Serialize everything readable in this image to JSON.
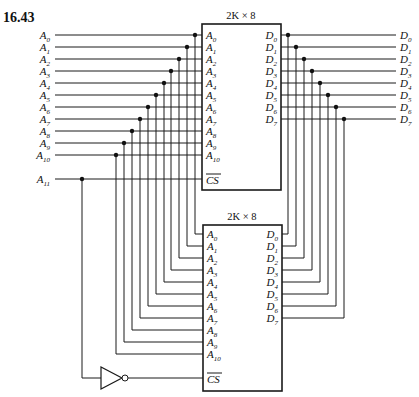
{
  "figure": {
    "number": "16.43"
  },
  "inputs": {
    "address_labels": [
      "A0",
      "A1",
      "A2",
      "A3",
      "A4",
      "A5",
      "A6",
      "A7",
      "A8",
      "A9",
      "A10"
    ],
    "select_label": "A11"
  },
  "outputs": {
    "data_labels": [
      "D0",
      "D1",
      "D2",
      "D3",
      "D4",
      "D5",
      "D6",
      "D7"
    ]
  },
  "chips": [
    {
      "id": "chip-top",
      "title": "2K × 8",
      "address_pins": [
        "A0",
        "A1",
        "A2",
        "A3",
        "A4",
        "A5",
        "A6",
        "A7",
        "A8",
        "A9",
        "A10"
      ],
      "data_pins": [
        "D0",
        "D1",
        "D2",
        "D3",
        "D4",
        "D5",
        "D6",
        "D7"
      ],
      "select_pin": "CS",
      "select_active_low": true
    },
    {
      "id": "chip-bottom",
      "title": "2K × 8",
      "address_pins": [
        "A0",
        "A1",
        "A2",
        "A3",
        "A4",
        "A5",
        "A6",
        "A7",
        "A8",
        "A9",
        "A10"
      ],
      "data_pins": [
        "D0",
        "D1",
        "D2",
        "D3",
        "D4",
        "D5",
        "D6",
        "D7"
      ],
      "select_pin": "CS",
      "select_active_low": true
    }
  ],
  "gates": [
    {
      "type": "inverter",
      "input": "A11",
      "output": "chip-bottom.CS"
    }
  ],
  "layout": {
    "addr_top_y0": 35,
    "row_pitch": 12,
    "cs_top_y": 179,
    "addr_bot_y0": 234,
    "cs_bot_y": 378,
    "addr_vert_x": [
      195,
      187,
      179,
      171,
      164,
      156,
      148,
      140,
      132,
      124,
      116
    ],
    "data_vert_x": [
      288,
      296,
      304,
      312,
      320,
      328,
      336,
      344
    ],
    "a11_x": 82
  }
}
